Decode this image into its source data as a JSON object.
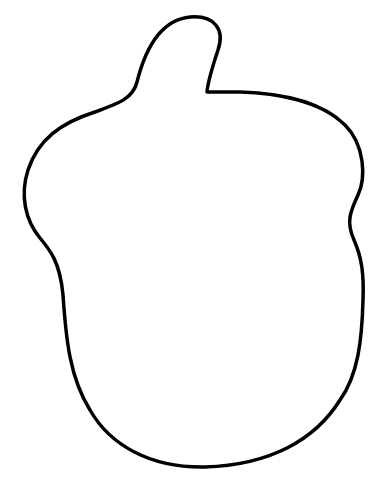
{
  "drawing": {
    "subject": "acorn-outline",
    "stroke_color": "#000000",
    "fill_color": "#ffffff",
    "background": "#ffffff",
    "stroke_width": 3.5
  }
}
